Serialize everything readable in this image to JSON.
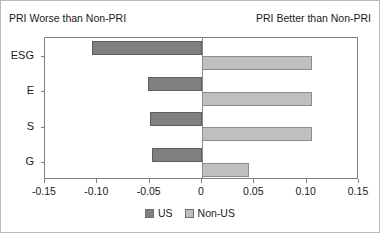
{
  "annotations": {
    "left": "PRI Worse than Non-PRI",
    "right": "PRI Better than Non-PRI"
  },
  "colors": {
    "us": "#808080",
    "non_us": "#bfbfbf",
    "axis": "#808080",
    "frame": "#b9b9b9"
  },
  "legend": {
    "position": "bottom-center",
    "entries": [
      {
        "label": "US",
        "color": "#808080"
      },
      {
        "label": "Non-US",
        "color": "#bfbfbf"
      }
    ]
  },
  "axis": {
    "xticklabels": [
      "-0.15",
      "-0.10",
      "-0.05",
      "0",
      "0.05",
      "0.10",
      "0.15"
    ],
    "xtickvalues": [
      -0.15,
      -0.1,
      -0.05,
      0,
      0.05,
      0.1,
      0.15
    ]
  },
  "chart_data": {
    "type": "bar",
    "orientation": "horizontal",
    "title": "",
    "subtitle": "",
    "xlabel": "",
    "ylabel": "",
    "categories": [
      "ESG",
      "E",
      "S",
      "G"
    ],
    "series": [
      {
        "name": "US",
        "color": "#808080",
        "values": [
          -0.105,
          -0.052,
          -0.05,
          -0.048
        ]
      },
      {
        "name": "Non-US",
        "color": "#bfbfbf",
        "values": [
          0.105,
          0.105,
          0.105,
          0.045
        ]
      }
    ],
    "xlim": [
      -0.15,
      0.15
    ],
    "xticks": [
      -0.15,
      -0.1,
      -0.05,
      0,
      0.05,
      0.1,
      0.15
    ],
    "xticklabels": [
      "-0.15",
      "-0.10",
      "-0.05",
      "0",
      "0.05",
      "0.10",
      "0.15"
    ],
    "grid": false,
    "legend": "bottom-center",
    "zero_reference_line": true,
    "annotations": [
      {
        "text": "PRI Worse than Non-PRI",
        "position": "top-left"
      },
      {
        "text": "PRI Better than Non-PRI",
        "position": "top-right"
      }
    ]
  }
}
